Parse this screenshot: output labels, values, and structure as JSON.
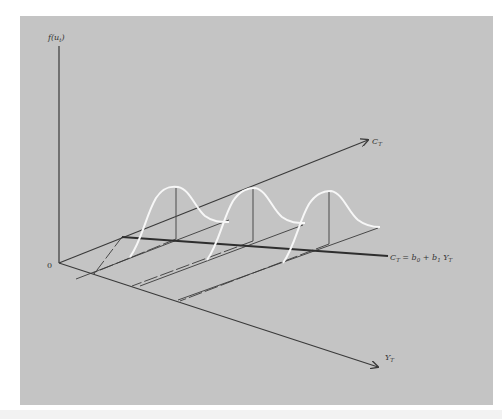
{
  "diagram": {
    "type": "3d-conditional-distribution",
    "labels": {
      "vertical_axis": "f(u",
      "vertical_axis_sub": "t",
      "vertical_axis_close": ")",
      "origin": "0",
      "c_axis": "C",
      "c_axis_sub": "T",
      "y_axis": "Y",
      "y_axis_sub": "T",
      "regression_line_lhs": "C",
      "regression_line_lhs_sub": "T",
      "regression_line_eq": " = b",
      "regression_b0_sub": "0",
      "regression_plus": " + b",
      "regression_b1_sub": "1",
      "regression_y": " Y",
      "regression_y_sub": "T"
    },
    "distributions": [
      {
        "peak_x": 176,
        "peak_y": 187,
        "base_y": 239
      },
      {
        "peak_x": 253,
        "peak_y": 188,
        "base_y": 241
      },
      {
        "peak_x": 329,
        "peak_y": 191,
        "base_y": 244
      }
    ],
    "colors": {
      "background": "#c4c4c4",
      "axis": "#3a3a3a",
      "curve": "#f7f7f7"
    }
  }
}
